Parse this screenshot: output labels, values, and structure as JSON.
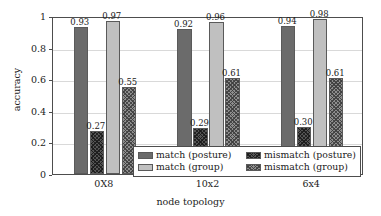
{
  "chart_data": {
    "type": "bar",
    "title": "",
    "xlabel": "node topology",
    "ylabel": "accuracy",
    "categories": [
      "0X8",
      "10x2",
      "6x4"
    ],
    "ylim": [
      0,
      1
    ],
    "yticks": [
      "0",
      "0.2",
      "0.4",
      "0.6",
      "0.8",
      "1"
    ],
    "ytick_values": [
      0,
      0.2,
      0.4,
      0.6,
      0.8,
      1
    ],
    "grid": "horizontal",
    "legend_position": "bottom-right-inside",
    "series": [
      {
        "name": "match (posture)",
        "style": "solid-dark",
        "color": "#6b6b6b",
        "values": [
          0.93,
          0.92,
          0.94
        ],
        "labels": [
          "0.93",
          "0.92",
          "0.94"
        ]
      },
      {
        "name": "mismatch (posture)",
        "style": "hatch-dark",
        "color": "#555555",
        "values": [
          0.27,
          0.29,
          0.3
        ],
        "labels": [
          "0.27",
          "0.29",
          "0.30"
        ]
      },
      {
        "name": "match (group)",
        "style": "solid-light",
        "color": "#c0c0c0",
        "values": [
          0.97,
          0.96,
          0.98
        ],
        "labels": [
          "0.97",
          "0.96",
          "0.98"
        ]
      },
      {
        "name": "mismatch (group)",
        "style": "hatch-mid",
        "color": "#8e8e8e",
        "values": [
          0.55,
          0.61,
          0.61
        ],
        "labels": [
          "0.55",
          "0.61",
          "0.61"
        ]
      }
    ],
    "legend_order": [
      "match (posture)",
      "mismatch (posture)",
      "match (group)",
      "mismatch (group)"
    ]
  }
}
